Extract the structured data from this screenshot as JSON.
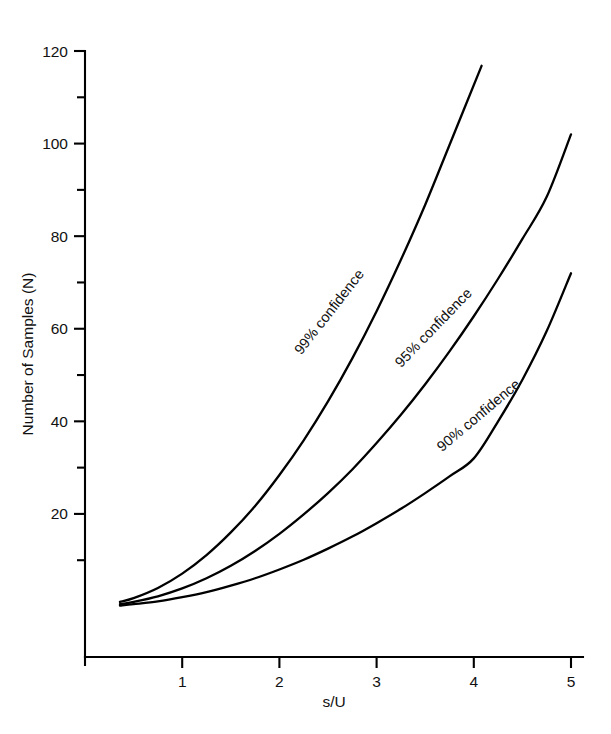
{
  "figure": {
    "background_color": "#ffffff",
    "line_color": "#000000",
    "text_color": "#111111"
  },
  "chart_data": {
    "type": "line",
    "title": "",
    "subtitle": "",
    "xlabel": "s/U",
    "ylabel": "Number of Samples (N)",
    "xlim": [
      0,
      5.35
    ],
    "ylim": [
      -11,
      120
    ],
    "grid": false,
    "legend_position": "inline-curve-labels",
    "x_ticks_major": [
      1,
      2,
      3,
      4,
      5
    ],
    "x_tick_labels": [
      "1",
      "2",
      "3",
      "4",
      "5"
    ],
    "y_ticks_major": [
      20,
      40,
      60,
      80,
      100,
      120
    ],
    "y_tick_labels": [
      "20",
      "40",
      "60",
      "80",
      "100",
      "120"
    ],
    "y_ticks_minor": [
      10,
      30,
      50,
      70,
      90,
      110
    ],
    "series": [
      {
        "name": "99% confidence",
        "label": "99% confidence",
        "label_angle_deg": -52,
        "x": [
          0.36,
          0.5,
          0.75,
          1.0,
          1.25,
          1.5,
          1.75,
          2.0,
          2.25,
          2.5,
          2.75,
          3.0,
          3.25,
          3.5,
          3.75,
          4.08
        ],
        "y": [
          1.0,
          1.8,
          4.0,
          7.1,
          11.1,
          16.0,
          21.7,
          28.4,
          35.9,
          44.3,
          53.6,
          63.8,
          74.9,
          86.8,
          99.7,
          116.8
        ]
      },
      {
        "name": "95% confidence",
        "label": "95% confidence",
        "label_angle_deg": -46,
        "x": [
          0.36,
          0.5,
          0.75,
          1.0,
          1.25,
          1.5,
          1.75,
          2.0,
          2.25,
          2.5,
          2.75,
          3.0,
          3.25,
          3.5,
          3.75,
          4.0,
          4.25,
          4.5,
          4.75,
          5.0
        ],
        "y": [
          0.5,
          1.0,
          2.2,
          3.9,
          6.1,
          8.8,
          12.0,
          15.7,
          19.9,
          24.5,
          29.6,
          35.3,
          41.4,
          48.0,
          55.1,
          62.7,
          70.8,
          79.4,
          88.5,
          102.0
        ]
      },
      {
        "name": "90% confidence",
        "label": "90% confidence",
        "label_angle_deg": -40,
        "x": [
          0.36,
          0.5,
          0.75,
          1.0,
          1.25,
          1.5,
          1.75,
          2.0,
          2.25,
          2.5,
          2.75,
          3.0,
          3.25,
          3.5,
          3.75,
          4.0,
          4.25,
          4.5,
          4.75,
          5.0
        ],
        "y": [
          0.2,
          0.5,
          1.1,
          2.0,
          3.1,
          4.5,
          6.1,
          8.0,
          10.1,
          12.5,
          15.1,
          18.0,
          21.1,
          24.5,
          28.1,
          32.0,
          40.0,
          49.0,
          59.5,
          72.0
        ]
      }
    ],
    "annotations": [
      {
        "text": "99% confidence",
        "x": 2.55,
        "y": 63.0,
        "angle_deg": -52
      },
      {
        "text": "95% confidence",
        "x": 3.62,
        "y": 59.5,
        "angle_deg": -46
      },
      {
        "text": "90% confidence",
        "x": 4.08,
        "y": 40.5,
        "angle_deg": -40
      }
    ]
  }
}
